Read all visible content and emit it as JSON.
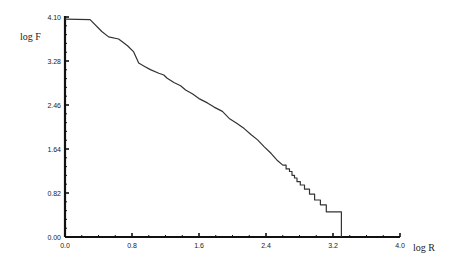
{
  "chart_data": {
    "type": "line",
    "title": "",
    "xlabel": "log R",
    "ylabel": "log F",
    "xlim": [
      0.0,
      4.0
    ],
    "ylim": [
      0.0,
      4.1
    ],
    "x_ticks": [
      "0.0",
      "0.8",
      "1.6",
      "2.4",
      "3.2",
      "4.0"
    ],
    "y_ticks": [
      "0.00",
      "0.82",
      "1.64",
      "2.46",
      "3.28",
      "4.10"
    ],
    "grid": false,
    "legend": null,
    "series": [
      {
        "name": "log F vs log R",
        "step_tail": true,
        "x": [
          0.0,
          0.3,
          0.44,
          0.52,
          0.64,
          0.7,
          0.75,
          0.82,
          0.88,
          0.95,
          1.02,
          1.12,
          1.18,
          1.22,
          1.3,
          1.38,
          1.44,
          1.52,
          1.6,
          1.7,
          1.78,
          1.88,
          1.96,
          2.05,
          2.14,
          2.22,
          2.3,
          2.38,
          2.46,
          2.54,
          2.6
        ],
        "y": [
          4.06,
          4.05,
          3.83,
          3.73,
          3.69,
          3.62,
          3.56,
          3.45,
          3.24,
          3.18,
          3.12,
          3.05,
          3.02,
          2.96,
          2.88,
          2.82,
          2.74,
          2.67,
          2.58,
          2.5,
          2.42,
          2.34,
          2.21,
          2.12,
          2.02,
          1.91,
          1.81,
          1.68,
          1.56,
          1.42,
          1.34
        ]
      }
    ],
    "steps": [
      [
        2.6,
        1.34
      ],
      [
        2.64,
        1.27
      ],
      [
        2.68,
        1.22
      ],
      [
        2.71,
        1.15
      ],
      [
        2.74,
        1.1
      ],
      [
        2.77,
        1.03
      ],
      [
        2.81,
        0.97
      ],
      [
        2.86,
        0.89
      ],
      [
        2.92,
        0.8
      ],
      [
        2.98,
        0.69
      ],
      [
        3.05,
        0.6
      ],
      [
        3.12,
        0.47
      ],
      [
        3.3,
        0.47
      ],
      [
        3.3,
        0.0
      ]
    ]
  }
}
